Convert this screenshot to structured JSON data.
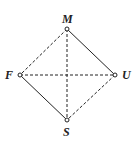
{
  "diagram": {
    "type": "graph",
    "nodes": [
      {
        "id": "M",
        "label": "M",
        "x": 67,
        "y": 29
      },
      {
        "id": "F",
        "label": "F",
        "x": 20,
        "y": 75
      },
      {
        "id": "U",
        "label": "U",
        "x": 115,
        "y": 75
      },
      {
        "id": "S",
        "label": "S",
        "x": 67,
        "y": 120
      }
    ],
    "edges": [
      {
        "from": "M",
        "to": "U",
        "style": "solid"
      },
      {
        "from": "F",
        "to": "S",
        "style": "solid"
      },
      {
        "from": "M",
        "to": "F",
        "style": "dashed"
      },
      {
        "from": "U",
        "to": "S",
        "style": "dashed"
      },
      {
        "from": "M",
        "to": "S",
        "style": "dashed"
      },
      {
        "from": "F",
        "to": "U",
        "style": "dashed"
      }
    ],
    "colors": {
      "line": "#222222",
      "background": "#ffffff"
    }
  }
}
